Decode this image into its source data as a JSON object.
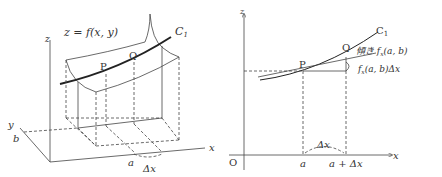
{
  "left_figure": {
    "surface_label": "z = f(x, y)",
    "curve_label": "C",
    "curve_subscript": "1",
    "point_p": "P",
    "point_q": "Q",
    "axis_z": "z",
    "axis_y": "y",
    "axis_x": "x",
    "tick_b": "b",
    "tick_a": "a",
    "delta_x": "Δx"
  },
  "right_figure": {
    "axis_z": "z",
    "axis_x": "x",
    "origin": "O",
    "curve_label": "C",
    "curve_subscript": "1",
    "point_p": "P",
    "point_q": "Q",
    "slope_label": "傾き f",
    "slope_sub": "x",
    "slope_args": "(a, b)",
    "increment_label": "f",
    "increment_sub": "x",
    "increment_args": "(a, b)Δx",
    "tick_a": "a",
    "tick_a_plus": "a + Δx",
    "delta_x": "Δx"
  },
  "colors": {
    "line": "#444444",
    "curve": "#222222",
    "text": "#333333"
  }
}
